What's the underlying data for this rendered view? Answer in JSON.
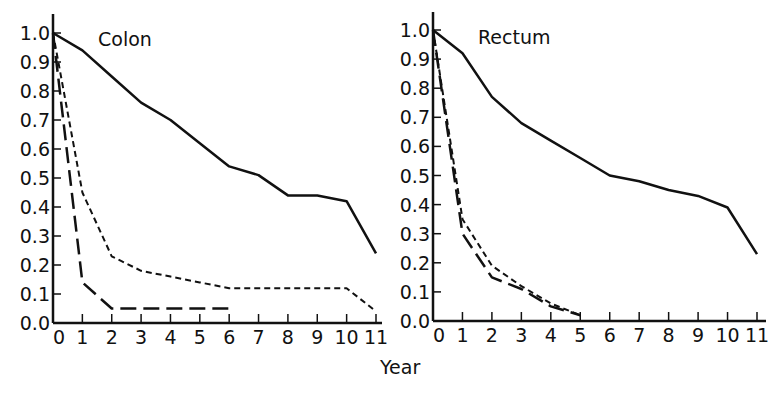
{
  "chart_data": [
    {
      "type": "line",
      "title": "Colon",
      "xlabel": "Year",
      "ylabel": "",
      "x": [
        0,
        1,
        2,
        3,
        4,
        5,
        6,
        7,
        8,
        9,
        10,
        11
      ],
      "xlim": [
        0,
        11
      ],
      "ylim": [
        0.0,
        1.0
      ],
      "yticks": [
        "0.0",
        "0.1",
        "0.2",
        "0.3",
        "0.4",
        "0.5",
        "0.6",
        "0.7",
        "0.8",
        "0.9",
        "1.0"
      ],
      "xticks": [
        "0",
        "1",
        "2",
        "3",
        "4",
        "5",
        "6",
        "7",
        "8",
        "9",
        "10",
        "11"
      ],
      "grid": false,
      "legend": "none",
      "series": [
        {
          "name": "solid",
          "style": "solid",
          "x": [
            0,
            1,
            2,
            3,
            4,
            5,
            6,
            7,
            8,
            9,
            10,
            11
          ],
          "values": [
            1.0,
            0.94,
            0.85,
            0.76,
            0.7,
            0.62,
            0.54,
            0.51,
            0.44,
            0.44,
            0.42,
            0.24
          ]
        },
        {
          "name": "short-dash",
          "style": "short-dash",
          "x": [
            0,
            1,
            2,
            3,
            4,
            5,
            6,
            7,
            8,
            9,
            10,
            11
          ],
          "values": [
            1.0,
            0.45,
            0.23,
            0.18,
            0.16,
            0.14,
            0.12,
            0.12,
            0.12,
            0.12,
            0.12,
            0.04
          ]
        },
        {
          "name": "long-dash",
          "style": "long-dash",
          "x": [
            0,
            1,
            2,
            3,
            4,
            5,
            6
          ],
          "values": [
            1.0,
            0.14,
            0.05,
            0.05,
            0.05,
            0.05,
            0.05
          ]
        }
      ]
    },
    {
      "type": "line",
      "title": "Rectum",
      "xlabel": "Year",
      "ylabel": "",
      "x": [
        0,
        1,
        2,
        3,
        4,
        5,
        6,
        7,
        8,
        9,
        10,
        11
      ],
      "xlim": [
        0,
        11
      ],
      "ylim": [
        0.0,
        1.0
      ],
      "yticks": [
        "0.0",
        "0.1",
        "0.2",
        "0.3",
        "0.4",
        "0.5",
        "0.6",
        "0.7",
        "0.8",
        "0.9",
        "1.0"
      ],
      "xticks": [
        "0",
        "1",
        "2",
        "3",
        "4",
        "5",
        "6",
        "7",
        "8",
        "9",
        "10",
        "11"
      ],
      "grid": false,
      "legend": "none",
      "series": [
        {
          "name": "solid",
          "style": "solid",
          "x": [
            0,
            1,
            2,
            3,
            4,
            5,
            6,
            7,
            8,
            9,
            10,
            11
          ],
          "values": [
            1.0,
            0.92,
            0.77,
            0.68,
            0.62,
            0.56,
            0.5,
            0.48,
            0.45,
            0.43,
            0.39,
            0.23
          ]
        },
        {
          "name": "short-dash",
          "style": "short-dash",
          "x": [
            0,
            1,
            2,
            3,
            4,
            5
          ],
          "values": [
            1.0,
            0.35,
            0.19,
            0.12,
            0.06,
            0.02
          ]
        },
        {
          "name": "long-dash",
          "style": "long-dash",
          "x": [
            0,
            1,
            2,
            3,
            4,
            5
          ],
          "values": [
            1.0,
            0.3,
            0.15,
            0.11,
            0.05,
            0.02
          ]
        }
      ]
    }
  ],
  "shared": {
    "xlabel": "Year",
    "line_color": "#111111"
  }
}
